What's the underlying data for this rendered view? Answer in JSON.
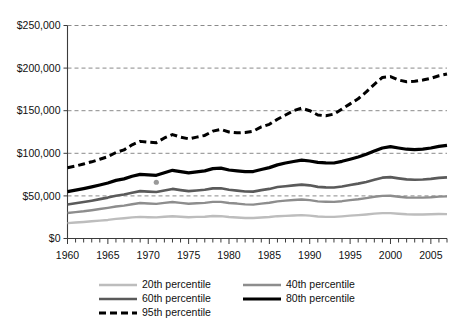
{
  "chart_data": {
    "type": "line",
    "title": "",
    "subtitle": "",
    "xlabel": "",
    "ylabel": "",
    "xlim": [
      1960,
      2007
    ],
    "ylim": [
      0,
      250000
    ],
    "grid": true,
    "grid_axis": "y",
    "grid_style": "dashed",
    "legend_position": "bottom",
    "legend_columns": 2,
    "y_ticks": [
      0,
      50000,
      100000,
      150000,
      200000,
      250000
    ],
    "y_tick_labels": [
      "$0",
      "$50,000",
      "$100,000",
      "$150,000",
      "$200,000",
      "$250,000"
    ],
    "x_ticks": [
      1960,
      1965,
      1970,
      1975,
      1980,
      1985,
      1990,
      1995,
      2000,
      2005
    ],
    "x_tick_labels": [
      "1960",
      "1965",
      "1970",
      "1975",
      "1980",
      "1985",
      "1990",
      "1995",
      "2000",
      "2005"
    ],
    "x_minor_tick_interval": 1,
    "x": [
      1960,
      1961,
      1962,
      1963,
      1964,
      1965,
      1966,
      1967,
      1968,
      1969,
      1970,
      1971,
      1972,
      1973,
      1974,
      1975,
      1976,
      1977,
      1978,
      1979,
      1980,
      1981,
      1982,
      1983,
      1984,
      1985,
      1986,
      1987,
      1988,
      1989,
      1990,
      1991,
      1992,
      1993,
      1994,
      1995,
      1996,
      1997,
      1998,
      1999,
      2000,
      2001,
      2002,
      2003,
      2004,
      2005,
      2006,
      2007
    ],
    "series": [
      {
        "name": "20th percentile",
        "color": "#bdbdbd",
        "width": 2.4,
        "dash": "none",
        "values": [
          18000,
          18800,
          19400,
          20200,
          21000,
          21800,
          23000,
          23800,
          24800,
          25400,
          25000,
          24800,
          25600,
          26200,
          25600,
          25000,
          25400,
          25600,
          26400,
          26200,
          25200,
          24600,
          24000,
          24000,
          24600,
          25200,
          26200,
          26600,
          27000,
          27400,
          26800,
          25800,
          25400,
          25400,
          26000,
          26800,
          27400,
          28200,
          29200,
          29800,
          29800,
          29000,
          28400,
          28200,
          28200,
          28400,
          28800,
          28600
        ]
      },
      {
        "name": "40th percentile",
        "color": "#8d8d8d",
        "width": 2.4,
        "dash": "none",
        "values": [
          30000,
          31000,
          32000,
          33200,
          34600,
          36000,
          37600,
          38600,
          40200,
          41600,
          41000,
          40600,
          41800,
          42800,
          41800,
          40800,
          41400,
          41800,
          43000,
          43000,
          41600,
          41000,
          40000,
          39800,
          41000,
          42000,
          43600,
          44400,
          45200,
          45800,
          45000,
          43600,
          43200,
          43000,
          43800,
          45000,
          46000,
          47400,
          49000,
          50000,
          50200,
          49000,
          48200,
          48000,
          48000,
          48400,
          49200,
          49400
        ]
      },
      {
        "name": "60th percentile",
        "color": "#5a5a5a",
        "width": 2.6,
        "dash": "none",
        "values": [
          40000,
          41400,
          42800,
          44400,
          46200,
          48000,
          50200,
          51600,
          53800,
          55600,
          55000,
          54600,
          56400,
          58200,
          56800,
          55600,
          56400,
          57200,
          58800,
          59000,
          57200,
          56200,
          55200,
          55000,
          56800,
          58200,
          60400,
          61400,
          62400,
          63200,
          62400,
          60600,
          60000,
          59800,
          61000,
          62800,
          64400,
          66400,
          69000,
          71400,
          72000,
          70600,
          69400,
          69000,
          69200,
          70000,
          71200,
          71800
        ]
      },
      {
        "name": "80th percentile",
        "color": "#000000",
        "width": 3.2,
        "dash": "none",
        "values": [
          55000,
          56800,
          58600,
          60600,
          62800,
          65200,
          68200,
          70000,
          73000,
          75200,
          74600,
          74200,
          77200,
          80000,
          78400,
          77000,
          78200,
          79400,
          82000,
          82600,
          80400,
          79400,
          78400,
          78600,
          81000,
          83200,
          86400,
          88600,
          90400,
          92000,
          91000,
          89400,
          88800,
          88600,
          90600,
          93000,
          95600,
          98800,
          102600,
          106200,
          107800,
          106200,
          104800,
          104400,
          105000,
          106200,
          108200,
          109400
        ]
      },
      {
        "name": "95th percentile",
        "color": "#000000",
        "width": 3.0,
        "dash": "7 4",
        "values": [
          83000,
          85000,
          87500,
          90000,
          93000,
          96000,
          101000,
          104000,
          110000,
          114000,
          113000,
          112500,
          118000,
          122000,
          119000,
          117000,
          119000,
          121000,
          126000,
          128000,
          125000,
          124000,
          124500,
          126000,
          131000,
          134000,
          140000,
          145000,
          150000,
          153000,
          150000,
          145000,
          144000,
          146000,
          152000,
          158000,
          164000,
          172000,
          181000,
          189000,
          190000,
          186000,
          184000,
          184500,
          186000,
          188000,
          191000,
          193000
        ]
      }
    ],
    "markers": [
      {
        "name": "data-point-1971",
        "x": 1971,
        "y": 66000,
        "color": "#9a9a9a",
        "radius": 2.6
      }
    ],
    "legend_entries": [
      {
        "label": "20th percentile",
        "color": "#bdbdbd",
        "width": 2.4,
        "dash": "none"
      },
      {
        "label": "40th percentile",
        "color": "#8d8d8d",
        "width": 2.4,
        "dash": "none"
      },
      {
        "label": "60th percentile",
        "color": "#5a5a5a",
        "width": 2.6,
        "dash": "none"
      },
      {
        "label": "80th percentile",
        "color": "#000000",
        "width": 3.2,
        "dash": "none"
      },
      {
        "label": "95th percentile",
        "color": "#000000",
        "width": 3.0,
        "dash": "7 4"
      }
    ]
  }
}
